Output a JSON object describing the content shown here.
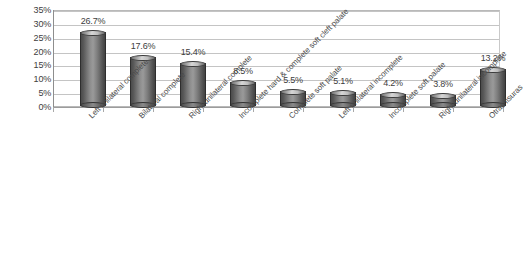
{
  "chart_data": {
    "type": "bar",
    "title": "",
    "subtitle": "",
    "xlabel": "",
    "ylabel": "",
    "ylim": [
      0,
      35
    ],
    "grid": true,
    "legend": "none",
    "y_ticks": [
      "0%",
      "5%",
      "10%",
      "15%",
      "20%",
      "25%",
      "30%",
      "35%"
    ],
    "y_tick_values": [
      0,
      5,
      10,
      15,
      20,
      25,
      30,
      35
    ],
    "categories": [
      "Left unilateral complete",
      "Bilateral complete",
      "Right unilateral complete",
      "Incomplete hard & complete soft cleft palate",
      "Complete soft palate",
      "Left unilateral incomplete",
      "Incomplete soft palate",
      "Right unilateral incomplete",
      "Otras fisuras"
    ],
    "values": [
      26.7,
      17.6,
      15.4,
      8.5,
      5.5,
      5.1,
      4.2,
      3.8,
      13.2
    ],
    "data_labels": [
      "26.7%",
      "17.6%",
      "15.4%",
      "8.5%",
      "5.5%",
      "5.1%",
      "4.2%",
      "3.8%",
      "13.2%"
    ],
    "colors": {
      "bar_dark": "#4b4b4b",
      "bar_light": "#9a9a9a",
      "gridline": "#c4c4c4",
      "axis": "#8e8e8e",
      "text": "#3d3d3d",
      "background": "#ffffff"
    }
  }
}
